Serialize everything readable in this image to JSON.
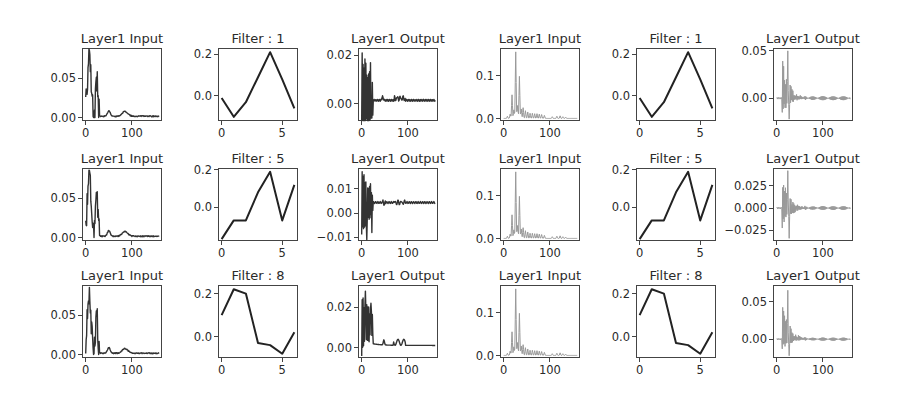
{
  "chart_data": {
    "type": "line",
    "layout": {
      "rows": 3,
      "cols": 6,
      "grid": false,
      "legend": false
    },
    "series_colors": {
      "model_a": "#333333",
      "model_b": "#999999"
    },
    "subplots": [
      {
        "row": 0,
        "col": 0,
        "title": "Layer1 Input",
        "kind": "spectrum_a",
        "color": "#333333",
        "xlim": [
          -8,
          165
        ],
        "ylim": [
          -0.004,
          0.088
        ],
        "xticks": [
          0,
          100
        ],
        "yticks": [
          0.0,
          0.05
        ],
        "ytick_labels": [
          "0.00",
          "0.05"
        ]
      },
      {
        "row": 0,
        "col": 1,
        "title": "Filter : 1",
        "kind": "filter",
        "color": "#222222",
        "x": [
          0,
          1,
          2,
          3,
          4,
          5,
          6
        ],
        "values": [
          -0.01,
          -0.1,
          -0.03,
          0.09,
          0.21,
          0.08,
          -0.06
        ],
        "xlim": [
          -0.3,
          6.3
        ],
        "ylim": [
          -0.12,
          0.23
        ],
        "xticks": [
          0,
          5
        ],
        "yticks": [
          0.0,
          0.2
        ],
        "ytick_labels": [
          "0.0",
          "0.2"
        ]
      },
      {
        "row": 0,
        "col": 2,
        "title": "Layer1 Output",
        "kind": "output_a1",
        "color": "#333333",
        "xlim": [
          -8,
          165
        ],
        "ylim": [
          -0.007,
          0.023
        ],
        "xticks": [
          0,
          100
        ],
        "yticks": [
          0.0,
          0.02
        ],
        "ytick_labels": [
          "0.00",
          "0.02"
        ]
      },
      {
        "row": 0,
        "col": 3,
        "title": "Layer1 Input",
        "kind": "spectrum_b",
        "color": "#999999",
        "xlim": [
          -8,
          165
        ],
        "ylim": [
          -0.005,
          0.165
        ],
        "xticks": [
          0,
          100
        ],
        "yticks": [
          0.0,
          0.1
        ],
        "ytick_labels": [
          "0.0",
          "0.1"
        ]
      },
      {
        "row": 0,
        "col": 4,
        "title": "Filter : 1",
        "kind": "filter",
        "color": "#222222",
        "x": [
          0,
          1,
          2,
          3,
          4,
          5,
          6
        ],
        "values": [
          -0.01,
          -0.1,
          -0.03,
          0.09,
          0.21,
          0.08,
          -0.06
        ],
        "xlim": [
          -0.3,
          6.3
        ],
        "ylim": [
          -0.12,
          0.23
        ],
        "xticks": [
          0,
          5
        ],
        "yticks": [
          0.0,
          0.2
        ],
        "ytick_labels": [
          "0.0",
          "0.2"
        ]
      },
      {
        "row": 0,
        "col": 5,
        "title": "Layer1 Output",
        "kind": "output_b",
        "amp": 0.05,
        "neg": 0.022,
        "color": "#999999",
        "xlim": [
          -8,
          165
        ],
        "ylim": [
          -0.024,
          0.053
        ],
        "xticks": [
          0,
          100
        ],
        "yticks": [
          0.0,
          0.05
        ],
        "ytick_labels": [
          "0.00",
          "0.05"
        ]
      },
      {
        "row": 1,
        "col": 0,
        "title": "Layer1 Input",
        "kind": "spectrum_a",
        "color": "#333333",
        "xlim": [
          -8,
          165
        ],
        "ylim": [
          -0.004,
          0.088
        ],
        "xticks": [
          0,
          100
        ],
        "yticks": [
          0.0,
          0.05
        ],
        "ytick_labels": [
          "0.00",
          "0.05"
        ]
      },
      {
        "row": 1,
        "col": 1,
        "title": "Filter : 5",
        "kind": "filter",
        "color": "#222222",
        "x": [
          0,
          1,
          2,
          3,
          4,
          5,
          6
        ],
        "values": [
          -0.17,
          -0.07,
          -0.07,
          0.08,
          0.19,
          -0.07,
          0.12
        ],
        "xlim": [
          -0.3,
          6.3
        ],
        "ylim": [
          -0.18,
          0.21
        ],
        "xticks": [
          0,
          5
        ],
        "yticks": [
          0.0,
          0.2
        ],
        "ytick_labels": [
          "0.0",
          "0.2"
        ]
      },
      {
        "row": 1,
        "col": 2,
        "title": "Layer1 Output",
        "kind": "output_a2",
        "color": "#333333",
        "xlim": [
          -8,
          165
        ],
        "ylim": [
          -0.0115,
          0.0185
        ],
        "xticks": [
          0,
          100
        ],
        "yticks": [
          -0.01,
          0.0,
          0.01
        ],
        "ytick_labels": [
          "−0.01",
          "0.00",
          "0.01"
        ]
      },
      {
        "row": 1,
        "col": 3,
        "title": "Layer1 Input",
        "kind": "spectrum_b",
        "color": "#999999",
        "xlim": [
          -8,
          165
        ],
        "ylim": [
          -0.005,
          0.165
        ],
        "xticks": [
          0,
          100
        ],
        "yticks": [
          0.0,
          0.1
        ],
        "ytick_labels": [
          "0.0",
          "0.1"
        ]
      },
      {
        "row": 1,
        "col": 4,
        "title": "Filter : 5",
        "kind": "filter",
        "color": "#222222",
        "x": [
          0,
          1,
          2,
          3,
          4,
          5,
          6
        ],
        "values": [
          -0.17,
          -0.07,
          -0.07,
          0.08,
          0.19,
          -0.07,
          0.12
        ],
        "xlim": [
          -0.3,
          6.3
        ],
        "ylim": [
          -0.18,
          0.21
        ],
        "xticks": [
          0,
          5
        ],
        "yticks": [
          0.0,
          0.2
        ],
        "ytick_labels": [
          "0.0",
          "0.2"
        ]
      },
      {
        "row": 1,
        "col": 5,
        "title": "Layer1 Output",
        "kind": "output_b",
        "amp": 0.042,
        "neg": 0.034,
        "color": "#999999",
        "xlim": [
          -8,
          165
        ],
        "ylim": [
          -0.037,
          0.045
        ],
        "xticks": [
          0,
          100
        ],
        "yticks": [
          -0.025,
          0.0,
          0.025
        ],
        "ytick_labels": [
          "−0.025",
          "0.000",
          "0.025"
        ]
      },
      {
        "row": 2,
        "col": 0,
        "title": "Layer1 Input",
        "kind": "spectrum_a",
        "color": "#333333",
        "xlim": [
          -8,
          165
        ],
        "ylim": [
          -0.004,
          0.088
        ],
        "xticks": [
          0,
          100
        ],
        "yticks": [
          0.0,
          0.05
        ],
        "ytick_labels": [
          "0.00",
          "0.05"
        ]
      },
      {
        "row": 2,
        "col": 1,
        "title": "Filter : 8",
        "kind": "filter",
        "color": "#222222",
        "x": [
          0,
          1,
          2,
          3,
          4,
          5,
          6
        ],
        "values": [
          0.1,
          0.22,
          0.2,
          -0.03,
          -0.04,
          -0.08,
          0.02
        ],
        "xlim": [
          -0.3,
          6.3
        ],
        "ylim": [
          -0.1,
          0.24
        ],
        "xticks": [
          0,
          5
        ],
        "yticks": [
          0.0,
          0.2
        ],
        "ytick_labels": [
          "0.0",
          "0.2"
        ]
      },
      {
        "row": 2,
        "col": 2,
        "title": "Layer1 Output",
        "kind": "output_a3",
        "color": "#333333",
        "xlim": [
          -8,
          165
        ],
        "ylim": [
          -0.005,
          0.031
        ],
        "xticks": [
          0,
          100
        ],
        "yticks": [
          0.0,
          0.02
        ],
        "ytick_labels": [
          "0.00",
          "0.02"
        ]
      },
      {
        "row": 2,
        "col": 3,
        "title": "Layer1 Input",
        "kind": "spectrum_b",
        "color": "#999999",
        "xlim": [
          -8,
          165
        ],
        "ylim": [
          -0.005,
          0.165
        ],
        "xticks": [
          0,
          100
        ],
        "yticks": [
          0.0,
          0.1
        ],
        "ytick_labels": [
          "0.0",
          "0.1"
        ]
      },
      {
        "row": 2,
        "col": 4,
        "title": "Filter : 8",
        "kind": "filter",
        "color": "#222222",
        "x": [
          0,
          1,
          2,
          3,
          4,
          5,
          6
        ],
        "values": [
          0.1,
          0.22,
          0.2,
          -0.03,
          -0.04,
          -0.08,
          0.02
        ],
        "xlim": [
          -0.3,
          6.3
        ],
        "ylim": [
          -0.1,
          0.24
        ],
        "xticks": [
          0,
          5
        ],
        "yticks": [
          0.0,
          0.2
        ],
        "ytick_labels": [
          "0.0",
          "0.2"
        ]
      },
      {
        "row": 2,
        "col": 5,
        "title": "Layer1 Output",
        "kind": "output_b",
        "amp": 0.065,
        "neg": 0.022,
        "color": "#999999",
        "xlim": [
          -8,
          165
        ],
        "ylim": [
          -0.025,
          0.072
        ],
        "xticks": [
          0,
          100
        ],
        "yticks": [
          0.0,
          0.05
        ],
        "ytick_labels": [
          "0.00",
          "0.05"
        ]
      }
    ],
    "notes": {
      "spectrum_a_peaks": [
        {
          "x": 8,
          "y": 0.085
        },
        {
          "x": 25,
          "y": 0.058
        },
        {
          "x": 50,
          "y": 0.01
        },
        {
          "x": 85,
          "y": 0.007
        }
      ],
      "spectrum_b_peaks": [
        {
          "x": 18,
          "y": 0.055
        },
        {
          "x": 26,
          "y": 0.155
        },
        {
          "x": 34,
          "y": 0.098
        },
        {
          "x": 42,
          "y": 0.025
        }
      ]
    }
  },
  "layout_px": {
    "col_x": [
      82,
      218,
      358,
      500,
      636,
      773
    ],
    "row_y": [
      48,
      168,
      285
    ],
    "axes_w": 80,
    "axes_h": 73
  }
}
